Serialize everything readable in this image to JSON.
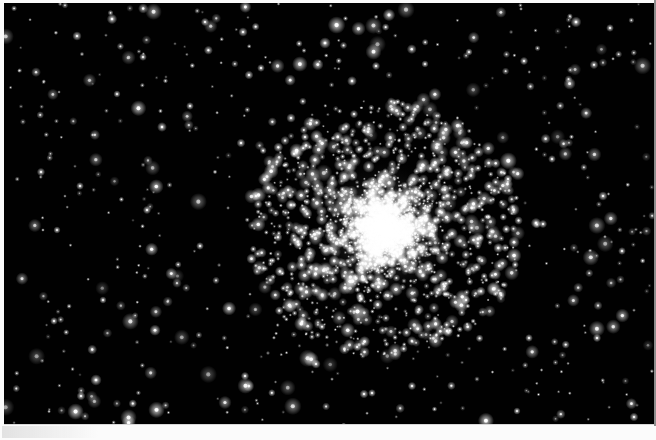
{
  "image": {
    "title": "Globular Star Cluster",
    "subject": "globular-cluster",
    "medium": "Black and white astronomical photograph (scanned print)",
    "orientation": "landscape",
    "width_px": 656,
    "height_px": 440,
    "alt_text": "A dense spherical swarm of thousands of white stars against a black night sky, surrounded by a scattered field of isolated stars."
  },
  "colors": {
    "paper": "#fbfbfb",
    "sky": "#010101",
    "star": "#ffffff",
    "core_glow": "#f2f2f2",
    "edge_line": "#8e8e8e",
    "smudge": "#cdcdcd"
  },
  "frame": {
    "left_px": 4,
    "top_px": 3,
    "width_px": 650,
    "height_px": 422,
    "border_left_px": 4,
    "border_top_px": 3,
    "border_right_px": 2,
    "border_bottom_px": 15
  },
  "cluster": {
    "name": "globular-cluster",
    "center_x": 384,
    "center_y": 229,
    "core_radius_px": 34,
    "halo_radius_px": 132,
    "core_star_count": 2600,
    "halo_star_count": 900,
    "field_star_count": 520,
    "core_glow_opacity": 0.42
  },
  "render": {
    "seed": 20240517,
    "field_star_min_size": 0.7,
    "field_star_max_size": 3.4,
    "core_star_min_size": 0.6,
    "core_star_max_size": 2.6
  },
  "bright_stars": [
    {
      "x": 389,
      "y": 15,
      "r": 2.4
    },
    {
      "x": 112,
      "y": 19,
      "r": 2.0
    },
    {
      "x": 205,
      "y": 22,
      "r": 1.6
    },
    {
      "x": 243,
      "y": 32,
      "r": 1.8
    },
    {
      "x": 325,
      "y": 43,
      "r": 2.2
    },
    {
      "x": 576,
      "y": 22,
      "r": 2.1
    },
    {
      "x": 610,
      "y": 28,
      "r": 1.5
    },
    {
      "x": 77,
      "y": 36,
      "r": 1.8
    },
    {
      "x": 143,
      "y": 57,
      "r": 1.5
    },
    {
      "x": 376,
      "y": 66,
      "r": 1.6
    },
    {
      "x": 425,
      "y": 64,
      "r": 1.4
    },
    {
      "x": 249,
      "y": 75,
      "r": 1.7
    },
    {
      "x": 261,
      "y": 68,
      "r": 1.5
    },
    {
      "x": 352,
      "y": 81,
      "r": 1.9
    },
    {
      "x": 469,
      "y": 52,
      "r": 1.4
    },
    {
      "x": 524,
      "y": 61,
      "r": 1.6
    },
    {
      "x": 117,
      "y": 94,
      "r": 1.4
    },
    {
      "x": 190,
      "y": 106,
      "r": 1.5
    },
    {
      "x": 291,
      "y": 118,
      "r": 1.8
    },
    {
      "x": 305,
      "y": 137,
      "r": 1.6
    },
    {
      "x": 241,
      "y": 143,
      "r": 1.7
    },
    {
      "x": 162,
      "y": 127,
      "r": 1.9
    },
    {
      "x": 41,
      "y": 172,
      "r": 1.6
    },
    {
      "x": 80,
      "y": 186,
      "r": 1.5
    },
    {
      "x": 57,
      "y": 230,
      "r": 1.4
    },
    {
      "x": 147,
      "y": 210,
      "r": 1.6
    },
    {
      "x": 200,
      "y": 246,
      "r": 1.5
    },
    {
      "x": 291,
      "y": 205,
      "r": 2.1
    },
    {
      "x": 256,
      "y": 196,
      "r": 1.8
    },
    {
      "x": 508,
      "y": 179,
      "r": 1.7
    },
    {
      "x": 552,
      "y": 159,
      "r": 1.5
    },
    {
      "x": 603,
      "y": 196,
      "r": 1.8
    },
    {
      "x": 536,
      "y": 223,
      "r": 2.0
    },
    {
      "x": 543,
      "y": 224,
      "r": 1.6
    },
    {
      "x": 622,
      "y": 251,
      "r": 1.5
    },
    {
      "x": 103,
      "y": 300,
      "r": 1.4
    },
    {
      "x": 54,
      "y": 321,
      "r": 1.5
    },
    {
      "x": 96,
      "y": 380,
      "r": 2.2
    },
    {
      "x": 81,
      "y": 396,
      "r": 1.7
    },
    {
      "x": 245,
      "y": 376,
      "r": 1.6
    },
    {
      "x": 316,
      "y": 364,
      "r": 1.8
    },
    {
      "x": 364,
      "y": 394,
      "r": 1.7
    },
    {
      "x": 372,
      "y": 393,
      "r": 1.5
    },
    {
      "x": 412,
      "y": 386,
      "r": 1.6
    },
    {
      "x": 447,
      "y": 331,
      "r": 2.0
    },
    {
      "x": 466,
      "y": 300,
      "r": 1.7
    },
    {
      "x": 529,
      "y": 338,
      "r": 1.5
    },
    {
      "x": 597,
      "y": 338,
      "r": 1.6
    },
    {
      "x": 634,
      "y": 417,
      "r": 1.7
    },
    {
      "x": 517,
      "y": 411,
      "r": 1.4
    }
  ]
}
